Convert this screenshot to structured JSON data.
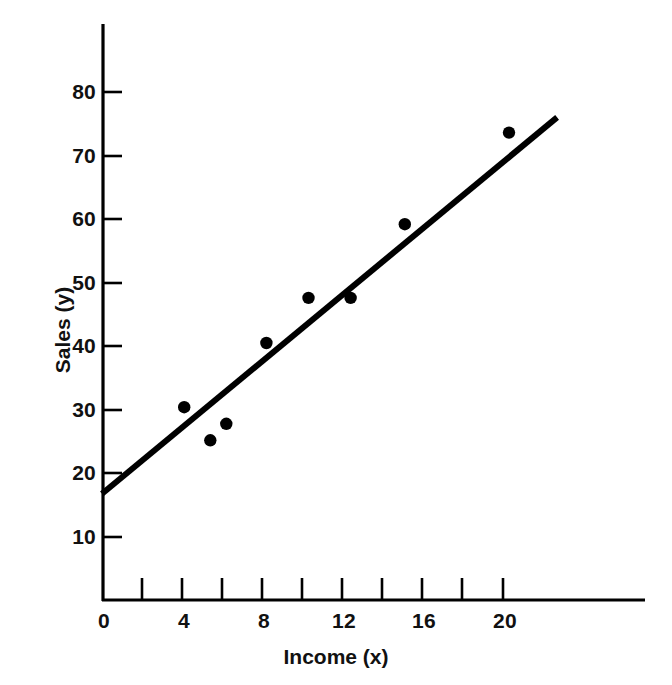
{
  "chart_data": {
    "type": "scatter",
    "title": "",
    "subtitle": "",
    "xlabel": "Income (x)",
    "ylabel": "Sales (y)",
    "xlim": [
      0,
      24
    ],
    "ylim": [
      0,
      88
    ],
    "grid": false,
    "legend": null,
    "x_major_ticks": [
      0,
      4,
      8,
      12,
      16,
      20
    ],
    "x_minor_ticks": [
      2,
      6,
      10,
      14,
      18
    ],
    "x_tick_labels": [
      "0",
      "4",
      "8",
      "12",
      "16",
      "20"
    ],
    "y_major_ticks": [
      10,
      20,
      30,
      40,
      50,
      60,
      70,
      80
    ],
    "y_tick_labels": [
      "10",
      "20",
      "30",
      "40",
      "50",
      "60",
      "70",
      "80"
    ],
    "points": [
      {
        "x": 4.1,
        "y": 30.4
      },
      {
        "x": 5.4,
        "y": 25.2
      },
      {
        "x": 6.2,
        "y": 27.8
      },
      {
        "x": 8.2,
        "y": 40.5
      },
      {
        "x": 10.3,
        "y": 47.6
      },
      {
        "x": 12.4,
        "y": 47.6
      },
      {
        "x": 15.1,
        "y": 59.2
      },
      {
        "x": 20.3,
        "y": 73.6
      }
    ],
    "series": [
      {
        "name": "Observations",
        "type": "scatter",
        "marker": "filled-circle",
        "color": "#000000",
        "x": [
          4.1,
          5.4,
          6.2,
          8.2,
          10.3,
          12.4,
          15.1,
          20.3
        ],
        "values": [
          30.4,
          25.2,
          27.8,
          40.5,
          47.6,
          47.6,
          59.2,
          73.6
        ]
      },
      {
        "name": "Fitted line",
        "type": "line",
        "color": "#000000",
        "x": [
          0,
          22.7
        ],
        "values": [
          16.8,
          76.0
        ]
      }
    ],
    "fit_line": {
      "intercept": 16.8,
      "slope": 2.61,
      "x_start": 0,
      "x_end": 22.7,
      "y_start": 16.8,
      "y_end": 76.0
    },
    "axis_color": "#000000",
    "marker_color": "#000000",
    "line_color": "#000000",
    "background_color": "#ffffff"
  }
}
